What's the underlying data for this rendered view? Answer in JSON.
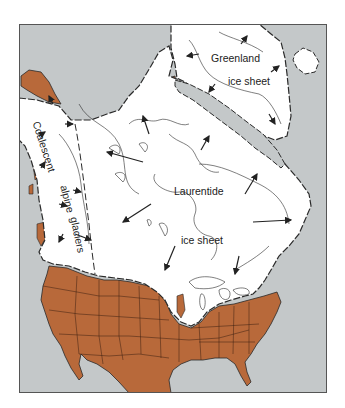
{
  "map": {
    "title": "",
    "colors": {
      "ocean": "#c4c8c9",
      "ice": "#ffffff",
      "unglaciated_land": "#b8693a",
      "outline": "#2a2a2a",
      "frame": "#555555"
    },
    "labels": {
      "greenland_line1": "Greenland",
      "greenland_line2": "ice sheet",
      "laurentide_line1": "Laurentide",
      "laurentide_line2": "ice sheet",
      "cordilleran_word1": "Coalescent",
      "cordilleran_word2": "alpine",
      "cordilleran_word3": "glaciers"
    },
    "legend": {
      "ice": "ice sheet (white)",
      "unglaciated": "unglaciated land (brown)",
      "ocean": "ocean (gray)",
      "arrows": "ice flow direction"
    }
  }
}
